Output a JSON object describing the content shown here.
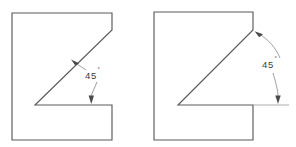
{
  "figure": {
    "background_color": "#ffffff",
    "outline_color": "#5a5a5a",
    "leader_color": "#8e8e8e",
    "text_color": "#3d3d3d"
  },
  "views": [
    {
      "id": "left-view",
      "name": "z-profile-straight-leader",
      "annotation": {
        "value": "45",
        "unit": "°",
        "label": "45°",
        "leader_style": "straight",
        "text_x": 85,
        "text_y": 75
      },
      "outline_points": "12,13 112,13 112,30 35,105 112,105 112,140 12,140",
      "arrow_to_diagonal": {
        "x": 73,
        "y": 62
      },
      "arrow_to_horizontal": {
        "x": 91,
        "y": 103
      }
    },
    {
      "id": "right-view",
      "name": "z-profile-arc-leader",
      "annotation": {
        "value": "45",
        "unit": "°",
        "label": "45°",
        "leader_style": "curved-arc",
        "text_x": 262,
        "text_y": 64
      },
      "outline_points": "154,12 253,12 253,30 178,105 253,105 253,140 154,140",
      "extension_line": {
        "x1": 253,
        "y1": 105,
        "x2": 289,
        "y2": 105
      },
      "arrow_to_diagonal": {
        "x": 256,
        "y": 33
      },
      "arrow_to_horizontal": {
        "x": 278,
        "y": 103
      }
    }
  ]
}
